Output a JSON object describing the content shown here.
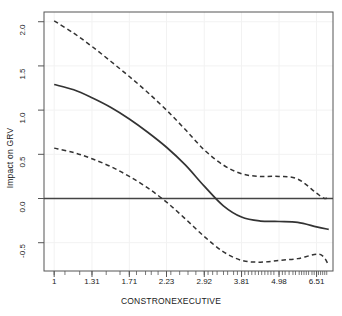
{
  "chart_data": {
    "type": "line",
    "title": "",
    "xlabel": "CONSTRONEXECUTIVE",
    "ylabel": "Impact on GRV",
    "xscale": "log",
    "xtick_labels": [
      "1",
      "1.31",
      "1.71",
      "2.23",
      "2.92",
      "3.81",
      "4.98",
      "6.51"
    ],
    "xtick_values": [
      1,
      1.31,
      1.71,
      2.23,
      2.92,
      3.81,
      4.98,
      6.51
    ],
    "ytick_labels": [
      "-0.5",
      "0.0",
      "0.5",
      "1.0",
      "1.5",
      "2.0"
    ],
    "ytick_values": [
      -0.5,
      0.0,
      0.5,
      1.0,
      1.5,
      2.0
    ],
    "ylim": [
      -0.82,
      2.11
    ],
    "grid": true,
    "legend": "none",
    "reference_line": {
      "name": "zero-line",
      "y": 0.0,
      "style": "solid"
    },
    "series": [
      {
        "name": "fitted-effect",
        "style": "solid",
        "color": "#333333",
        "x": [
          1,
          1.15,
          1.31,
          1.5,
          1.71,
          1.95,
          2.23,
          2.55,
          2.92,
          3.34,
          3.81,
          4.36,
          4.98,
          5.69,
          6.51,
          7.1
        ],
        "values": [
          1.29,
          1.23,
          1.14,
          1.03,
          0.9,
          0.75,
          0.58,
          0.38,
          0.14,
          -0.08,
          -0.21,
          -0.255,
          -0.26,
          -0.27,
          -0.32,
          -0.35
        ]
      },
      {
        "name": "upper-confidence-band",
        "style": "dashed",
        "color": "#333333",
        "x": [
          1,
          1.15,
          1.31,
          1.5,
          1.71,
          1.95,
          2.23,
          2.55,
          2.92,
          3.34,
          3.81,
          4.36,
          4.98,
          5.69,
          6.51,
          6.9,
          7.1
        ],
        "values": [
          2.01,
          1.87,
          1.72,
          1.55,
          1.38,
          1.2,
          1.0,
          0.78,
          0.55,
          0.38,
          0.28,
          0.25,
          0.25,
          0.22,
          0.06,
          0.0,
          0.03
        ]
      },
      {
        "name": "lower-confidence-band",
        "style": "dashed",
        "color": "#333333",
        "x": [
          1,
          1.15,
          1.31,
          1.5,
          1.71,
          1.95,
          2.23,
          2.55,
          2.92,
          3.34,
          3.81,
          4.36,
          4.98,
          5.69,
          6.51,
          6.85,
          7.1
        ],
        "values": [
          0.57,
          0.52,
          0.45,
          0.36,
          0.25,
          0.12,
          -0.04,
          -0.23,
          -0.43,
          -0.6,
          -0.7,
          -0.72,
          -0.7,
          -0.68,
          -0.63,
          -0.66,
          -0.76
        ]
      }
    ],
    "rug_ticks": [
      1.0,
      1.08,
      1.2,
      1.31,
      1.45,
      1.6,
      1.71,
      1.8,
      1.92,
      2.0,
      2.1,
      2.23,
      2.3,
      2.45,
      2.6,
      2.75,
      2.92,
      3.0,
      3.1,
      3.2,
      3.35,
      3.45,
      3.6,
      3.7,
      3.81,
      3.9,
      4.0,
      4.1,
      4.2,
      4.3,
      4.4,
      4.5,
      4.6,
      4.7,
      4.8,
      4.98,
      5.1,
      5.2,
      5.35,
      5.5,
      5.6,
      5.75,
      5.85,
      5.95,
      6.05,
      6.15,
      6.3,
      6.4,
      6.51,
      6.6,
      6.7,
      6.8,
      6.9,
      7.0
    ]
  },
  "style": {
    "line_color": "#333333",
    "axis_color": "#555555",
    "grid_color": "#f2f2f2",
    "background": "#ffffff"
  }
}
